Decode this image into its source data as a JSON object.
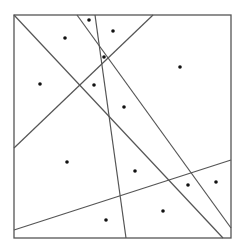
{
  "diagram": {
    "type": "line-arrangement-with-points",
    "stroke_color": "#555555",
    "point_color": "#111111",
    "frame": {
      "x1": 14,
      "y1": 15,
      "x2": 231,
      "y2": 238
    },
    "lines": [
      {
        "id": "diag-main",
        "x1": 14,
        "y1": 15,
        "x2": 223,
        "y2": 238
      },
      {
        "id": "diag-steep",
        "x1": 77,
        "y1": 15,
        "x2": 231,
        "y2": 228
      },
      {
        "id": "near-vertical",
        "x1": 95,
        "y1": 15,
        "x2": 126,
        "y2": 238
      },
      {
        "id": "anti-diag",
        "x1": 153,
        "y1": 15,
        "x2": 14,
        "y2": 148
      },
      {
        "id": "low-rising",
        "x1": 14,
        "y1": 230,
        "x2": 231,
        "y2": 160
      }
    ],
    "points": [
      {
        "x": 89,
        "y": 20
      },
      {
        "x": 113,
        "y": 31
      },
      {
        "x": 65,
        "y": 38
      },
      {
        "x": 104,
        "y": 57
      },
      {
        "x": 180,
        "y": 67
      },
      {
        "x": 40,
        "y": 84
      },
      {
        "x": 94,
        "y": 85
      },
      {
        "x": 124,
        "y": 107
      },
      {
        "x": 67,
        "y": 162
      },
      {
        "x": 135,
        "y": 171
      },
      {
        "x": 188,
        "y": 185
      },
      {
        "x": 216,
        "y": 182
      },
      {
        "x": 163,
        "y": 211
      },
      {
        "x": 106,
        "y": 220
      }
    ]
  }
}
